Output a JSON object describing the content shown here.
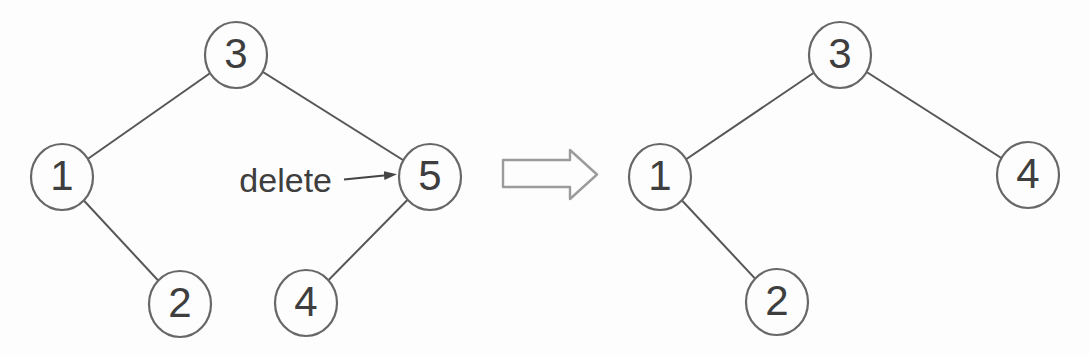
{
  "figure": {
    "annotation": {
      "label": "delete"
    },
    "transform_arrow": {
      "symbol": "right-block-arrow"
    },
    "before_tree": {
      "name": "before-deletion",
      "nodes": [
        {
          "label": "3",
          "x": 236,
          "y": 55
        },
        {
          "label": "1",
          "x": 62,
          "y": 177
        },
        {
          "label": "5",
          "x": 430,
          "y": 177
        },
        {
          "label": "2",
          "x": 180,
          "y": 304
        },
        {
          "label": "4",
          "x": 306,
          "y": 303
        }
      ],
      "edges": [
        [
          0,
          1
        ],
        [
          0,
          2
        ],
        [
          1,
          3
        ],
        [
          2,
          4
        ]
      ]
    },
    "after_tree": {
      "name": "after-deletion",
      "nodes": [
        {
          "label": "3",
          "x": 840,
          "y": 55
        },
        {
          "label": "1",
          "x": 660,
          "y": 177
        },
        {
          "label": "4",
          "x": 1028,
          "y": 175
        },
        {
          "label": "2",
          "x": 777,
          "y": 302
        }
      ],
      "edges": [
        [
          0,
          1
        ],
        [
          0,
          2
        ],
        [
          1,
          3
        ]
      ]
    },
    "colors": {
      "background": "#fdfdfd",
      "node_fill": "#fdfdfd",
      "node_stroke": "#676767",
      "edge_stroke": "#565656",
      "text": "#3e3e3e",
      "block_arrow_stroke": "#9b9b9b",
      "annotation_arrow": "#454545"
    }
  }
}
